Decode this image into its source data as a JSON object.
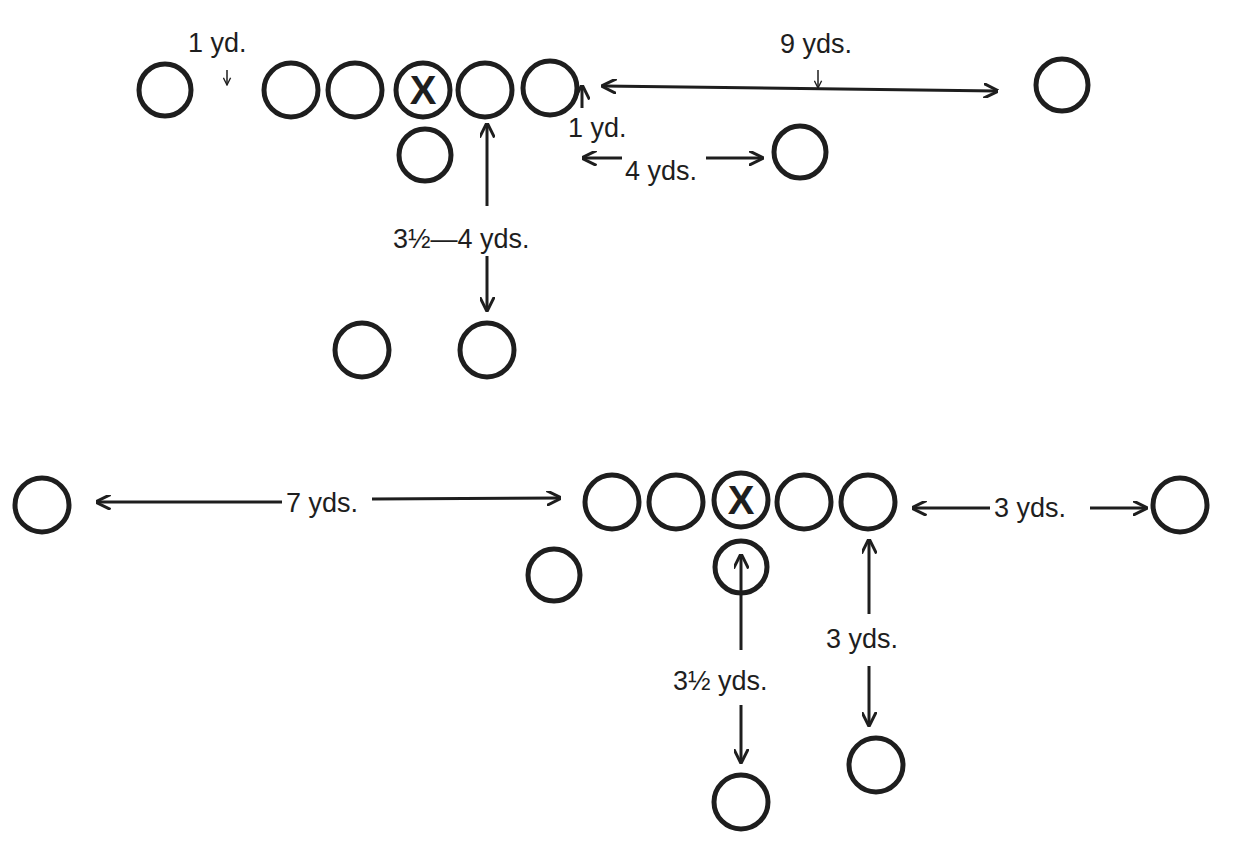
{
  "diagram": {
    "colors": {
      "ink": "#1e1e1e",
      "background": "#ffffff"
    },
    "formations": [
      {
        "id": "top",
        "players": [
          {
            "role": "left-end",
            "x": 165,
            "y": 90
          },
          {
            "role": "left-tackle",
            "x": 291,
            "y": 90
          },
          {
            "role": "left-guard",
            "x": 355,
            "y": 90
          },
          {
            "role": "center",
            "x": 423,
            "y": 90,
            "marker": "X"
          },
          {
            "role": "right-guard",
            "x": 485,
            "y": 90
          },
          {
            "role": "right-tackle",
            "x": 550,
            "y": 88
          },
          {
            "role": "quarterback",
            "x": 425,
            "y": 155
          },
          {
            "role": "wingback",
            "x": 800,
            "y": 152
          },
          {
            "role": "split-end",
            "x": 1062,
            "y": 85
          },
          {
            "role": "left-halfback",
            "x": 362,
            "y": 350
          },
          {
            "role": "fullback",
            "x": 487,
            "y": 350
          }
        ],
        "labels": {
          "split_left": "1 yd.",
          "split_end_right": "9 yds.",
          "wing_depth": "1 yd.",
          "wing_width": "4 yds.",
          "backfield_depth": "3½—4 yds."
        }
      },
      {
        "id": "bottom",
        "players": [
          {
            "role": "split-end-left",
            "x": 42,
            "y": 505
          },
          {
            "role": "left-tackle",
            "x": 612,
            "y": 502
          },
          {
            "role": "left-guard",
            "x": 676,
            "y": 502
          },
          {
            "role": "center",
            "x": 741,
            "y": 500,
            "marker": "X"
          },
          {
            "role": "right-guard",
            "x": 804,
            "y": 502
          },
          {
            "role": "right-tackle",
            "x": 868,
            "y": 502
          },
          {
            "role": "flanker-right",
            "x": 1180,
            "y": 505
          },
          {
            "role": "slotback",
            "x": 554,
            "y": 575
          },
          {
            "role": "quarterback",
            "x": 741,
            "y": 567
          },
          {
            "role": "tailback",
            "x": 741,
            "y": 802
          },
          {
            "role": "halfback",
            "x": 876,
            "y": 765
          }
        ],
        "labels": {
          "split_end_left": "7 yds.",
          "flanker_right": "3 yds.",
          "tailback_depth": "3½ yds.",
          "halfback_depth": "3 yds."
        }
      }
    ]
  }
}
